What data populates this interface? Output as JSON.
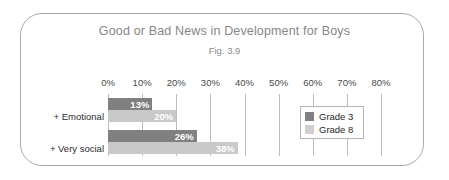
{
  "frame": {
    "shape": "rounded-rectangle",
    "border_color": "#a9a9a9"
  },
  "chart_data": {
    "type": "bar",
    "orientation": "horizontal",
    "title": "Good or Bad News in Development for Boys",
    "subtitle": "Fig. 3.9",
    "xlabel": "",
    "ylabel": "",
    "categories": [
      "+ Emotional",
      "+ Very social"
    ],
    "series": [
      {
        "name": "Grade 3",
        "color": "#808080",
        "values": [
          13,
          26
        ],
        "labels": [
          "13%",
          "26%"
        ]
      },
      {
        "name": "Grade 8",
        "color": "#c9c9c9",
        "values": [
          20,
          38
        ],
        "labels": [
          "20%",
          "38%"
        ]
      }
    ],
    "xlim": [
      0,
      80
    ],
    "xtick_values": [
      0,
      10,
      20,
      30,
      40,
      50,
      60,
      70,
      80
    ],
    "xtick_labels": [
      "0%",
      "10%",
      "20%",
      "30%",
      "40%",
      "50%",
      "60%",
      "70%",
      "80%"
    ],
    "grid": true,
    "grid_color": "#bdbdbd",
    "legend_position": "right-inside",
    "value_label_color": "#ffffff"
  }
}
